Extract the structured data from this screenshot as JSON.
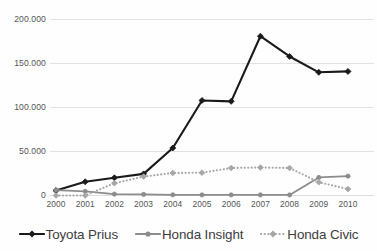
{
  "chart_data": {
    "type": "line",
    "title": "",
    "subtitle": "",
    "xlabel": "",
    "ylabel": "",
    "categories": [
      "2000",
      "2001",
      "2002",
      "2003",
      "2004",
      "2005",
      "2006",
      "2007",
      "2008",
      "2009",
      "2010"
    ],
    "x": [
      2000,
      2001,
      2002,
      2003,
      2004,
      2005,
      2006,
      2007,
      2008,
      2009,
      2010
    ],
    "ylim": [
      0,
      200000
    ],
    "xlim": [
      2000,
      2010
    ],
    "y_ticks": [
      0,
      50000,
      100000,
      150000,
      200000
    ],
    "y_tick_labels": [
      "0",
      "50.000",
      "100.000",
      "150.000",
      "200.000"
    ],
    "grid": "horizontal",
    "legend_position": "bottom",
    "series": [
      {
        "name": "Toyota Prius",
        "color": "#1a1a1a",
        "style": "solid",
        "marker": "diamond",
        "values": [
          5600,
          15600,
          20100,
          24600,
          54000,
          108000,
          107000,
          181000,
          158000,
          140000,
          141000
        ]
      },
      {
        "name": "Honda Insight",
        "color": "#8c8c8c",
        "style": "solid",
        "marker": "circle",
        "values": [
          6200,
          4700,
          1600,
          1200,
          800,
          700,
          700,
          700,
          600,
          20500,
          22000
        ]
      },
      {
        "name": "Honda Civic",
        "color": "#a6a6a6",
        "style": "dotted",
        "marker": "diamond",
        "values": [
          0,
          0,
          14000,
          21500,
          25600,
          25900,
          31300,
          31800,
          31300,
          15100,
          7300
        ]
      }
    ]
  },
  "legend": {
    "items": [
      {
        "label": "Toyota Prius",
        "icon": "line-marker-icon"
      },
      {
        "label": "Honda Insight",
        "icon": "line-marker-icon"
      },
      {
        "label": "Honda Civic",
        "icon": "dotted-line-marker-icon"
      }
    ]
  },
  "colors": {
    "prius": "#1a1a1a",
    "insight": "#8c8c8c",
    "civic": "#a6a6a6",
    "grid": "#d9d9d9",
    "text": "#555555",
    "background": "#fefefe"
  }
}
